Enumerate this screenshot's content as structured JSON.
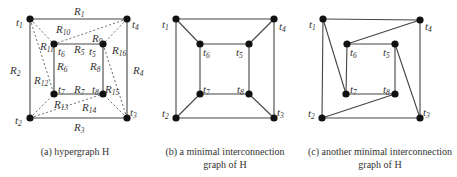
{
  "figure": {
    "panels": [
      {
        "id": "a",
        "caption_line1": "(a) hypergraph H",
        "caption_line2": "",
        "nodes": [
          {
            "id": "t1",
            "x": 30,
            "y": 19,
            "label": "t",
            "sub": "1",
            "lx": 16,
            "ly": 26
          },
          {
            "id": "t4",
            "x": 127,
            "y": 19,
            "label": "t",
            "sub": "4",
            "lx": 132,
            "ly": 28
          },
          {
            "id": "t2",
            "x": 30,
            "y": 118,
            "label": "t",
            "sub": "2",
            "lx": 15,
            "ly": 124
          },
          {
            "id": "t3",
            "x": 127,
            "y": 118,
            "label": "t",
            "sub": "3",
            "lx": 130,
            "ly": 116
          },
          {
            "id": "t6",
            "x": 54,
            "y": 44,
            "label": "t",
            "sub": "6",
            "lx": 58,
            "ly": 55
          },
          {
            "id": "t5",
            "x": 103,
            "y": 44,
            "label": "t",
            "sub": "5",
            "lx": 89,
            "ly": 55
          },
          {
            "id": "t7",
            "x": 54,
            "y": 94,
            "label": "t",
            "sub": "7",
            "lx": 58,
            "ly": 93
          },
          {
            "id": "t8",
            "x": 103,
            "y": 94,
            "label": "t",
            "sub": "8",
            "lx": 92,
            "ly": 93
          }
        ],
        "edges": [
          [
            "t1",
            "t4"
          ],
          [
            "t4",
            "t3"
          ],
          [
            "t3",
            "t2"
          ],
          [
            "t2",
            "t1"
          ],
          [
            "t6",
            "t5"
          ],
          [
            "t5",
            "t8"
          ],
          [
            "t8",
            "t7"
          ],
          [
            "t7",
            "t6"
          ]
        ],
        "dashed_edges": [
          [
            "t1",
            "t6"
          ],
          [
            "t1",
            "t7"
          ],
          [
            "t4",
            "t6"
          ],
          [
            "t4",
            "t5"
          ],
          [
            "t3",
            "t5"
          ],
          [
            "t3",
            "t8"
          ],
          [
            "t2",
            "t7"
          ],
          [
            "t2",
            "t8"
          ]
        ],
        "edge_labels": [
          {
            "text": "R",
            "sub": "1",
            "x": 74,
            "y": 15
          },
          {
            "text": "R",
            "sub": "2",
            "x": 10,
            "y": 74
          },
          {
            "text": "R",
            "sub": "3",
            "x": 74,
            "y": 131
          },
          {
            "text": "R",
            "sub": "4",
            "x": 133,
            "y": 74
          },
          {
            "text": "R",
            "sub": "5",
            "x": 74,
            "y": 53
          },
          {
            "text": "R",
            "sub": "6",
            "x": 57,
            "y": 70
          },
          {
            "text": "R",
            "sub": "7",
            "x": 74,
            "y": 93
          },
          {
            "text": "R",
            "sub": "8",
            "x": 90,
            "y": 70
          },
          {
            "text": "R",
            "sub": "9",
            "x": 92,
            "y": 42
          },
          {
            "text": "R",
            "sub": "10",
            "x": 56,
            "y": 33
          },
          {
            "text": "R",
            "sub": "11",
            "x": 40,
            "y": 50
          },
          {
            "text": "R",
            "sub": "12",
            "x": 34,
            "y": 84
          },
          {
            "text": "R",
            "sub": "13",
            "x": 54,
            "y": 108
          },
          {
            "text": "R",
            "sub": "14",
            "x": 82,
            "y": 111
          },
          {
            "text": "R",
            "sub": "15",
            "x": 105,
            "y": 93
          },
          {
            "text": "R",
            "sub": "16",
            "x": 112,
            "y": 54
          }
        ]
      },
      {
        "id": "b",
        "caption_line1": "(b) a minimal interconnection",
        "caption_line2": "graph of H",
        "nodes": [
          {
            "id": "t1",
            "x": 176,
            "y": 19,
            "label": "t",
            "sub": "1",
            "lx": 162,
            "ly": 28
          },
          {
            "id": "t4",
            "x": 274,
            "y": 19,
            "label": "t",
            "sub": "4",
            "lx": 279,
            "ly": 30
          },
          {
            "id": "t2",
            "x": 176,
            "y": 118,
            "label": "t",
            "sub": "2",
            "lx": 162,
            "ly": 117
          },
          {
            "id": "t3",
            "x": 274,
            "y": 118,
            "label": "t",
            "sub": "3",
            "lx": 277,
            "ly": 116
          },
          {
            "id": "t6",
            "x": 200,
            "y": 44,
            "label": "t",
            "sub": "6",
            "lx": 203,
            "ly": 56
          },
          {
            "id": "t5",
            "x": 249,
            "y": 44,
            "label": "t",
            "sub": "5",
            "lx": 236,
            "ly": 56
          },
          {
            "id": "t7",
            "x": 200,
            "y": 94,
            "label": "t",
            "sub": "7",
            "lx": 203,
            "ly": 93
          },
          {
            "id": "t8",
            "x": 249,
            "y": 94,
            "label": "t",
            "sub": "8",
            "lx": 237,
            "ly": 93
          }
        ],
        "edges": [
          [
            "t1",
            "t4"
          ],
          [
            "t4",
            "t3"
          ],
          [
            "t3",
            "t2"
          ],
          [
            "t2",
            "t1"
          ],
          [
            "t6",
            "t5"
          ],
          [
            "t5",
            "t8"
          ],
          [
            "t8",
            "t7"
          ],
          [
            "t7",
            "t6"
          ],
          [
            "t1",
            "t6"
          ],
          [
            "t4",
            "t5"
          ],
          [
            "t3",
            "t8"
          ],
          [
            "t2",
            "t7"
          ]
        ]
      },
      {
        "id": "c",
        "caption_line1": "(c) another minimal interconnection",
        "caption_line2": "graph of H",
        "nodes": [
          {
            "id": "t1",
            "x": 323,
            "y": 19,
            "label": "t",
            "sub": "1",
            "lx": 309,
            "ly": 28
          },
          {
            "id": "t4",
            "x": 420,
            "y": 20,
            "label": "t",
            "sub": "4",
            "lx": 425,
            "ly": 30
          },
          {
            "id": "t2",
            "x": 322,
            "y": 118,
            "label": "t",
            "sub": "2",
            "lx": 308,
            "ly": 117
          },
          {
            "id": "t3",
            "x": 420,
            "y": 118,
            "label": "t",
            "sub": "3",
            "lx": 423,
            "ly": 116
          },
          {
            "id": "t6",
            "x": 347,
            "y": 44,
            "label": "t",
            "sub": "6",
            "lx": 350,
            "ly": 56
          },
          {
            "id": "t5",
            "x": 395,
            "y": 44,
            "label": "t",
            "sub": "5",
            "lx": 383,
            "ly": 56
          },
          {
            "id": "t7",
            "x": 346,
            "y": 94,
            "label": "t",
            "sub": "7",
            "lx": 350,
            "ly": 93
          },
          {
            "id": "t8",
            "x": 395,
            "y": 94,
            "label": "t",
            "sub": "8",
            "lx": 383,
            "ly": 93
          }
        ],
        "edges": [
          [
            "t1",
            "t4"
          ],
          [
            "t4",
            "t3"
          ],
          [
            "t3",
            "t2"
          ],
          [
            "t2",
            "t1"
          ],
          [
            "t6",
            "t5"
          ],
          [
            "t5",
            "t8"
          ],
          [
            "t8",
            "t7"
          ],
          [
            "t7",
            "t6"
          ],
          [
            "t1",
            "t7"
          ],
          [
            "t4",
            "t6"
          ],
          [
            "t5",
            "t3"
          ],
          [
            "t8",
            "t2"
          ]
        ]
      }
    ]
  }
}
